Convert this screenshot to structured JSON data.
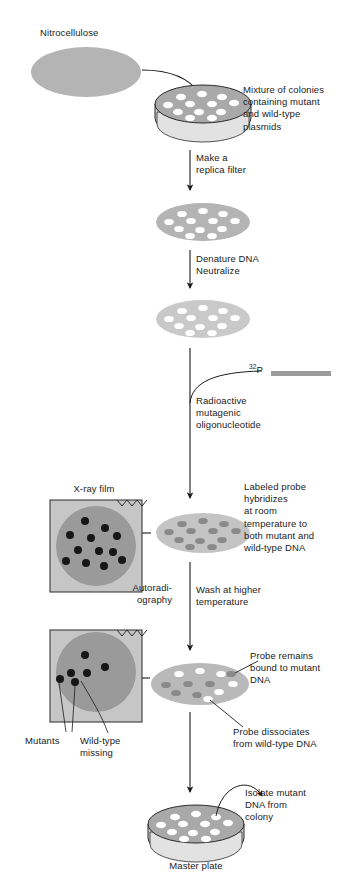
{
  "figure": {
    "background_color": "#ffffff",
    "ink_color": "#1b1b1b"
  },
  "palette": {
    "filter_gray": "#b4b4b4",
    "filter_light_gray": "#c9c9c9",
    "dish_medium_gray": "#a9a9a9",
    "colony_white": "#ffffff",
    "probe_dark_gray": "#8a8a8a",
    "film_frame_gray": "#c6c6c6",
    "film_circle_gray": "#9a9a9a",
    "spot_black": "#161616",
    "probe_bar_gray": "#9b9b9b",
    "outline": "#2b2b2b"
  },
  "labels": {
    "nitrocellulose": "Nitrocellulose",
    "mixture_of_colonies": "Mixture of colonies\ncontaining mutant\nand wild-type\nplasmids",
    "make_replica_filter": "Make a\nreplica filter",
    "denature_neutralize": "Denature DNA\nNeutralize",
    "p32_superscript": "32",
    "p32_base": "P",
    "radioactive_probe": "Radioactive\nmutagenic\noligonucleotide",
    "labeled_probe": "Labeled probe\nhybridizes\nat room\ntemperature to\nboth mutant and\nwild-type DNA",
    "xray_film": "X-ray film",
    "autoradiography": "Autoradi-\nography",
    "wash_higher_temp": "Wash at higher\ntemperature",
    "probe_remains": "Probe remains\nbound to mutant\nDNA",
    "probe_dissociates": "Probe dissociates\nfrom wild-type DNA",
    "mutants": "Mutants",
    "wild_type_missing": "Wild-type\nmissing",
    "isolate_mutant": "Isolate mutant\nDNA from\ncolony",
    "master_plate": "Master plate"
  },
  "stages": [
    {
      "id": "nitrocellulose-disc",
      "name": "Nitrocellulose filter disc",
      "shape": "ellipse",
      "cx": 86,
      "cy": 72,
      "rx": 55,
      "ry": 25,
      "fill": "#b4b4b4",
      "colonies": 0
    },
    {
      "id": "master-dish-top",
      "name": "Petri dish with mixed colonies",
      "shape": "petri-dish",
      "cx": 203,
      "cy": 108,
      "rx": 48,
      "ry": 19,
      "fill": "#a9a9a9",
      "colony_count": 12,
      "colony_color": "#ffffff"
    },
    {
      "id": "replica-filter",
      "name": "Replica filter after lifting colonies",
      "shape": "ellipse",
      "cx": 203,
      "cy": 222,
      "rx": 47,
      "ry": 19,
      "fill": "#b4b4b4",
      "colony_count": 12,
      "colony_color": "#ffffff"
    },
    {
      "id": "denatured-filter",
      "name": "Filter after DNA denaturation and neutralization",
      "shape": "ellipse",
      "cx": 203,
      "cy": 319,
      "rx": 47,
      "ry": 19,
      "fill": "#c9c9c9",
      "colony_count": 12,
      "colony_color": "#ffffff"
    },
    {
      "id": "hybridized-filter",
      "name": "Filter after room-temperature hybridization",
      "shape": "ellipse",
      "cx": 203,
      "cy": 533,
      "rx": 47,
      "ry": 20,
      "fill": "#c4c4c4",
      "colony_count": 12,
      "colony_color": "#8a8a8a"
    },
    {
      "id": "washed-filter",
      "name": "Filter after high-temperature wash",
      "shape": "ellipse",
      "cx": 200,
      "cy": 684,
      "rx": 49,
      "ry": 21,
      "fill": "#b9b9b9",
      "colony_count": 12,
      "mutant_spots": 6,
      "washed_spots": 6
    },
    {
      "id": "master-plate-bottom",
      "name": "Master plate for mutant isolation",
      "shape": "petri-dish",
      "cx": 196,
      "cy": 828,
      "rx": 48,
      "ry": 19,
      "fill": "#a9a9a9",
      "colony_count": 12,
      "colony_color": "#ffffff"
    }
  ],
  "films": [
    {
      "id": "film-all-colonies",
      "name": "First autoradiogram - all colonies hybridize",
      "x": 50,
      "y": 500,
      "w": 92,
      "h": 92,
      "spot_count": 12,
      "frame_fill": "#c6c6c6",
      "circle_fill": "#9a9a9a",
      "spot_fill": "#161616"
    },
    {
      "id": "film-mutants-only",
      "name": "Second autoradiogram - only mutants retain probe",
      "x": 50,
      "y": 630,
      "w": 92,
      "h": 92,
      "spot_count": 6,
      "frame_fill": "#c6c6c6",
      "circle_fill": "#9a9a9a",
      "spot_fill": "#161616"
    }
  ],
  "probe_bar": {
    "name": "Radioactive oligonucleotide probe bar",
    "x": 271,
    "y": 371,
    "w": 60,
    "h": 5,
    "fill": "#9b9b9b"
  }
}
